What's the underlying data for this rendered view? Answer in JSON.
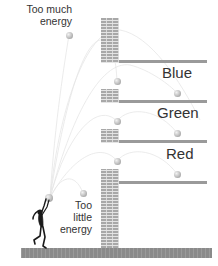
{
  "diagram": {
    "labels": {
      "too_much_line1": "Too much",
      "too_much_line2": "energy",
      "too_little_line1": "Too",
      "too_little_line2": "little",
      "too_little_line3": "energy"
    },
    "shelves": [
      {
        "name": "Blue",
        "label": "Blue"
      },
      {
        "name": "Green",
        "label": "Green"
      },
      {
        "name": "Red",
        "label": "Red"
      }
    ],
    "figure": "person-throwing-ball-silhouette",
    "colors": {
      "wall": "#a8a8a8",
      "shelf": "#9a9a9a",
      "ground": "#8a8a8a",
      "text": "#333333",
      "ball": "#bdbdbd",
      "trajectory": "#e8e8e8"
    }
  }
}
